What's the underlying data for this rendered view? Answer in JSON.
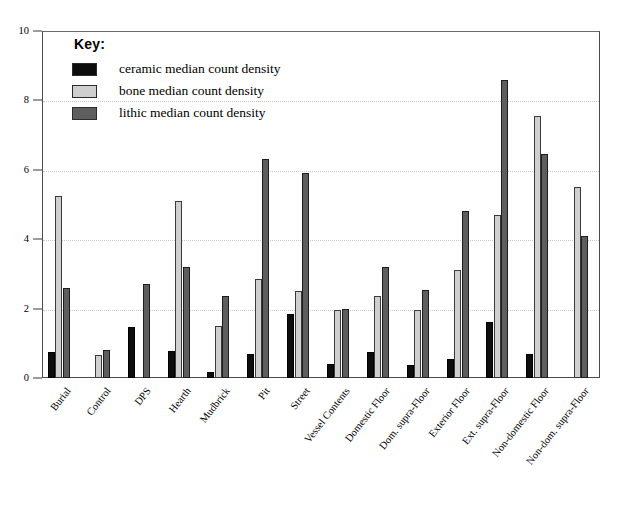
{
  "chart_data": {
    "type": "bar",
    "title": "",
    "xlabel": "",
    "ylabel": "",
    "ylim": [
      0,
      10
    ],
    "yticks": [
      0,
      2,
      4,
      6,
      8,
      10
    ],
    "grid": true,
    "legend_position": "upper-left-inside",
    "legend_title": "Key:",
    "categories": [
      "Burial",
      "Control",
      "DPS",
      "Hearth",
      "Mudbrick",
      "Pit",
      "Street",
      "Vessel Contents",
      "Domestic Floor",
      "Dom. supra-Floor",
      "Exterior Floor",
      "Ext. supra-Floor",
      "Non-domestic Floor",
      "Non-dom. supra-Floor"
    ],
    "series": [
      {
        "name": "ceramic median count density",
        "color": "#0d0d0d",
        "values": [
          0.75,
          0,
          1.48,
          0.78,
          0.18,
          0.7,
          1.85,
          0.4,
          0.75,
          0.38,
          0.55,
          1.6,
          0.7,
          0
        ]
      },
      {
        "name": "bone median count density",
        "color": "#cfcfcf",
        "values": [
          5.25,
          0.65,
          0,
          5.1,
          1.5,
          2.85,
          2.5,
          1.95,
          2.35,
          1.95,
          3.1,
          4.7,
          7.55,
          5.5
        ]
      },
      {
        "name": "lithic median count density",
        "color": "#5e5e5e",
        "values": [
          2.6,
          0.8,
          2.7,
          3.2,
          2.35,
          6.3,
          5.9,
          2.0,
          3.2,
          2.55,
          4.8,
          8.6,
          6.45,
          4.1
        ]
      }
    ]
  },
  "legend": {
    "title": "Key:",
    "items": [
      {
        "label": "ceramic median count density",
        "swatch": "ceramic"
      },
      {
        "label": "bone median count density",
        "swatch": "bone"
      },
      {
        "label": "lithic median count density",
        "swatch": "lithic"
      }
    ]
  },
  "axis": {
    "y_tick_labels": [
      "0",
      "2",
      "4",
      "6",
      "8",
      "10"
    ]
  }
}
